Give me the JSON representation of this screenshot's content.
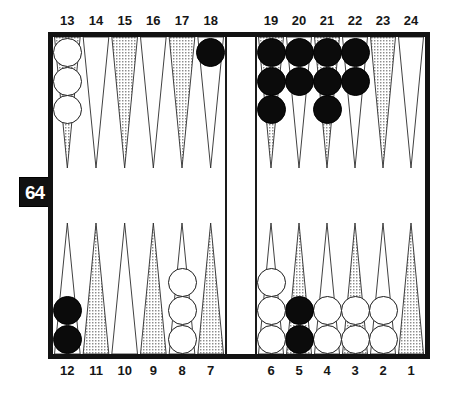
{
  "app": {
    "title": "Backgammon Board Position"
  },
  "doubling_cube": {
    "name": "doubling-cube",
    "value": "64"
  },
  "board": {
    "top_labels": [
      "13",
      "14",
      "15",
      "16",
      "17",
      "18",
      "19",
      "20",
      "21",
      "22",
      "23",
      "24"
    ],
    "bottom_labels": [
      "12",
      "11",
      "10",
      "9",
      "8",
      "7",
      "6",
      "5",
      "4",
      "3",
      "2",
      "1"
    ],
    "frame_color": "#121212",
    "point_shaded_color": "#b9b9b9",
    "point_plain_color": "#ffffff",
    "checker_white_color": "#ffffff",
    "checker_black_color": "#0b0b0b"
  },
  "chart_data": {
    "type": "table",
    "columns": [
      "point",
      "quadrant",
      "checker_color",
      "count",
      "triangle_shade"
    ],
    "points": [
      {
        "point": "13",
        "quadrant": "top-left",
        "checker_color": "white",
        "count": 3,
        "triangle_shade": "shaded"
      },
      {
        "point": "14",
        "quadrant": "top-left",
        "checker_color": "none",
        "count": 0,
        "triangle_shade": "plain"
      },
      {
        "point": "15",
        "quadrant": "top-left",
        "checker_color": "none",
        "count": 0,
        "triangle_shade": "shaded"
      },
      {
        "point": "16",
        "quadrant": "top-left",
        "checker_color": "none",
        "count": 0,
        "triangle_shade": "plain"
      },
      {
        "point": "17",
        "quadrant": "top-left",
        "checker_color": "none",
        "count": 0,
        "triangle_shade": "shaded"
      },
      {
        "point": "18",
        "quadrant": "top-left",
        "checker_color": "black",
        "count": 1,
        "triangle_shade": "plain"
      },
      {
        "point": "19",
        "quadrant": "top-right",
        "checker_color": "black",
        "count": 3,
        "triangle_shade": "shaded"
      },
      {
        "point": "20",
        "quadrant": "top-right",
        "checker_color": "black",
        "count": 2,
        "triangle_shade": "plain"
      },
      {
        "point": "21",
        "quadrant": "top-right",
        "checker_color": "black",
        "count": 3,
        "triangle_shade": "shaded"
      },
      {
        "point": "22",
        "quadrant": "top-right",
        "checker_color": "black",
        "count": 2,
        "triangle_shade": "plain"
      },
      {
        "point": "23",
        "quadrant": "top-right",
        "checker_color": "none",
        "count": 0,
        "triangle_shade": "shaded"
      },
      {
        "point": "24",
        "quadrant": "top-right",
        "checker_color": "none",
        "count": 0,
        "triangle_shade": "plain"
      },
      {
        "point": "12",
        "quadrant": "bottom-left",
        "checker_color": "black",
        "count": 2,
        "triangle_shade": "plain"
      },
      {
        "point": "11",
        "quadrant": "bottom-left",
        "checker_color": "none",
        "count": 0,
        "triangle_shade": "shaded"
      },
      {
        "point": "10",
        "quadrant": "bottom-left",
        "checker_color": "none",
        "count": 0,
        "triangle_shade": "plain"
      },
      {
        "point": "9",
        "quadrant": "bottom-left",
        "checker_color": "none",
        "count": 0,
        "triangle_shade": "shaded"
      },
      {
        "point": "8",
        "quadrant": "bottom-left",
        "checker_color": "white",
        "count": 3,
        "triangle_shade": "plain"
      },
      {
        "point": "7",
        "quadrant": "bottom-left",
        "checker_color": "none",
        "count": 0,
        "triangle_shade": "shaded"
      },
      {
        "point": "6",
        "quadrant": "bottom-right",
        "checker_color": "white",
        "count": 3,
        "triangle_shade": "plain"
      },
      {
        "point": "5",
        "quadrant": "bottom-right",
        "checker_color": "black",
        "count": 2,
        "triangle_shade": "shaded"
      },
      {
        "point": "4",
        "quadrant": "bottom-right",
        "checker_color": "white",
        "count": 2,
        "triangle_shade": "plain"
      },
      {
        "point": "3",
        "quadrant": "bottom-right",
        "checker_color": "white",
        "count": 2,
        "triangle_shade": "shaded"
      },
      {
        "point": "2",
        "quadrant": "bottom-right",
        "checker_color": "white",
        "count": 2,
        "triangle_shade": "plain"
      },
      {
        "point": "1",
        "quadrant": "bottom-right",
        "checker_color": "none",
        "count": 0,
        "triangle_shade": "shaded"
      }
    ],
    "totals": {
      "white_on_board": 11,
      "black_on_board": 13
    },
    "bar": {
      "white": 0,
      "black": 0
    }
  }
}
